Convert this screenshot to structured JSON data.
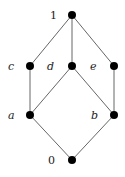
{
  "diagram": {
    "type": "hasse-diagram",
    "nodes": [
      {
        "id": "top",
        "label": "1",
        "x": 72,
        "y": 15,
        "lx": 50,
        "ly": 19,
        "italic": false
      },
      {
        "id": "c",
        "label": "c",
        "x": 30,
        "y": 66,
        "lx": 8,
        "ly": 70,
        "italic": true
      },
      {
        "id": "d",
        "label": "d",
        "x": 72,
        "y": 66,
        "lx": 47,
        "ly": 70,
        "italic": true
      },
      {
        "id": "e",
        "label": "e",
        "x": 114,
        "y": 66,
        "lx": 90,
        "ly": 70,
        "italic": true
      },
      {
        "id": "a",
        "label": "a",
        "x": 30,
        "y": 115,
        "lx": 8,
        "ly": 119,
        "italic": true
      },
      {
        "id": "b",
        "label": "b",
        "x": 114,
        "y": 115,
        "lx": 91,
        "ly": 119,
        "italic": true
      },
      {
        "id": "bottom",
        "label": "0",
        "x": 72,
        "y": 160,
        "lx": 48,
        "ly": 164,
        "italic": false
      }
    ],
    "edges": [
      [
        "top",
        "c"
      ],
      [
        "top",
        "d"
      ],
      [
        "top",
        "e"
      ],
      [
        "c",
        "a"
      ],
      [
        "d",
        "a"
      ],
      [
        "d",
        "b"
      ],
      [
        "e",
        "b"
      ],
      [
        "a",
        "bottom"
      ],
      [
        "b",
        "bottom"
      ]
    ]
  }
}
